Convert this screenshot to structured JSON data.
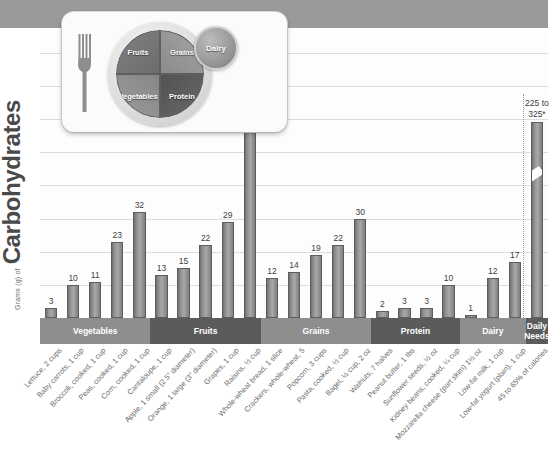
{
  "yaxis": {
    "small": "Grams (g) of",
    "big": "Carbohydrates"
  },
  "plate": {
    "fruits": "Fruits",
    "grains": "Grains",
    "vegetables": "Vegetables",
    "protein": "Protein",
    "dairy": "Dairy"
  },
  "daily_needs": {
    "caption": "225 to\n325*",
    "caption_line1": "225 to",
    "caption_line2": "325*"
  },
  "bands": [
    {
      "label": "Vegetables",
      "shade": "light",
      "count": 5
    },
    {
      "label": "Fruits",
      "shade": "dark",
      "count": 5
    },
    {
      "label": "Grains",
      "shade": "light",
      "count": 5
    },
    {
      "label": "Protein",
      "shade": "dark",
      "count": 4
    },
    {
      "label": "Dairy",
      "shade": "light",
      "count": 3
    },
    {
      "label": "Daily\nNeeds",
      "shade": "dark",
      "count": 1
    }
  ],
  "chart_data": {
    "type": "bar",
    "title": "",
    "xlabel": "",
    "ylabel": "Grams (g) of Carbohydrates",
    "ylim": [
      0,
      70
    ],
    "grid": true,
    "legend": false,
    "categories": [
      "Lettuce, 2 cups",
      "Baby carrots, 1 cup",
      "Broccoli, cooked, 1 cup",
      "Peas, cooked, 1 cup",
      "Corn, cooked, 1 cup",
      "Cantaloupe, 1 cup",
      "Apple, 1 small (2.5\" diameter)",
      "Orange, 1 large (3\" diameter)",
      "Grapes, 1 cup",
      "Raisins, ½ cup",
      "Whole-wheat bread, 1 slice",
      "Crackers, whole-wheat, 5",
      "Popcorn, 3 cups",
      "Pasta, cooked, ½ cup",
      "Bagel, ½ cup, 2 oz",
      "Walnuts, 7 halves",
      "Peanut butter, 1 tbs",
      "Sunflower seeds, ½ oz",
      "Kidney beans, cooked, ¼ cup",
      "Mozzarella cheese (part skim) 1½ oz",
      "Low-fat milk, 1 cup",
      "Low-fat yogurt (plain), 1 cup",
      "45 to 65% of calories"
    ],
    "values": [
      3,
      10,
      11,
      23,
      32,
      13,
      15,
      22,
      29,
      65,
      12,
      14,
      19,
      22,
      30,
      2,
      3,
      3,
      10,
      1,
      12,
      17,
      275
    ],
    "value_labels": [
      "3",
      "10",
      "11",
      "23",
      "32",
      "13",
      "15",
      "22",
      "29",
      "65",
      "12",
      "14",
      "19",
      "22",
      "30",
      "2",
      "3",
      "3",
      "10",
      "1",
      "12",
      "17",
      "225 to 325*"
    ],
    "groups": [
      "Vegetables",
      "Vegetables",
      "Vegetables",
      "Vegetables",
      "Vegetables",
      "Fruits",
      "Fruits",
      "Fruits",
      "Fruits",
      "Fruits",
      "Grains",
      "Grains",
      "Grains",
      "Grains",
      "Grains",
      "Protein",
      "Protein",
      "Protein",
      "Protein",
      "Dairy",
      "Dairy",
      "Dairy",
      "Daily Needs"
    ],
    "axis_break": {
      "series_index": 22,
      "note": "bar truncated with break mark"
    }
  }
}
